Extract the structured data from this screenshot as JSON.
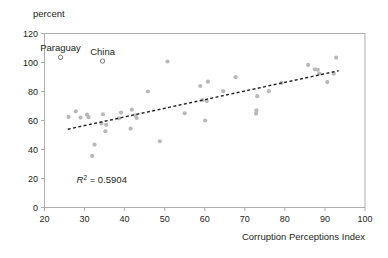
{
  "chart_data": {
    "type": "scatter",
    "title": "",
    "subtitle": "",
    "unit_label": "percent",
    "xlabel": "Corruption Perceptions Index",
    "ylabel": "",
    "xlim": [
      20,
      100
    ],
    "ylim": [
      0,
      120
    ],
    "xticks": [
      20,
      30,
      40,
      50,
      60,
      70,
      80,
      90,
      100
    ],
    "yticks": [
      0,
      20,
      40,
      60,
      80,
      100,
      120
    ],
    "grid": false,
    "legend": "none",
    "marker_color": "#b9b9b9",
    "highlight_marker_color": "#6d6d6d",
    "trendline_color": "#231f20",
    "axis_color": "#9a9a9a",
    "annotations": [
      {
        "label": "R² = 0.5904",
        "x": 28,
        "y": 17,
        "italic_prefix": "R",
        "superscript": "2",
        "rest": " = 0.5904"
      }
    ],
    "series": [
      {
        "name": "countries",
        "marker": "filled-circle",
        "points": [
          {
            "x": 26.0,
            "y": 62.5
          },
          {
            "x": 27.8,
            "y": 66.3
          },
          {
            "x": 29.0,
            "y": 62.0
          },
          {
            "x": 30.6,
            "y": 64.0
          },
          {
            "x": 31.0,
            "y": 62.3
          },
          {
            "x": 31.9,
            "y": 35.6
          },
          {
            "x": 32.5,
            "y": 43.3
          },
          {
            "x": 34.2,
            "y": 58.0
          },
          {
            "x": 34.6,
            "y": 64.3
          },
          {
            "x": 35.2,
            "y": 52.6
          },
          {
            "x": 35.4,
            "y": 57.0
          },
          {
            "x": 38.6,
            "y": 61.5
          },
          {
            "x": 39.1,
            "y": 65.5
          },
          {
            "x": 41.5,
            "y": 54.4
          },
          {
            "x": 41.8,
            "y": 67.5
          },
          {
            "x": 42.7,
            "y": 63.6
          },
          {
            "x": 43.0,
            "y": 61.8
          },
          {
            "x": 45.8,
            "y": 80.0
          },
          {
            "x": 48.8,
            "y": 45.7
          },
          {
            "x": 50.7,
            "y": 100.7
          },
          {
            "x": 55.0,
            "y": 65.0
          },
          {
            "x": 58.9,
            "y": 83.8
          },
          {
            "x": 59.4,
            "y": 74.0
          },
          {
            "x": 60.1,
            "y": 60.0
          },
          {
            "x": 60.5,
            "y": 73.4
          },
          {
            "x": 60.8,
            "y": 86.8
          },
          {
            "x": 64.6,
            "y": 80.2
          },
          {
            "x": 67.7,
            "y": 89.9
          },
          {
            "x": 72.8,
            "y": 64.8
          },
          {
            "x": 72.9,
            "y": 67.0
          },
          {
            "x": 73.1,
            "y": 76.8
          },
          {
            "x": 76.0,
            "y": 80.2
          },
          {
            "x": 79.2,
            "y": 86.0
          },
          {
            "x": 85.8,
            "y": 98.3
          },
          {
            "x": 87.5,
            "y": 95.3
          },
          {
            "x": 88.2,
            "y": 95.0
          },
          {
            "x": 88.6,
            "y": 92.4
          },
          {
            "x": 90.6,
            "y": 86.5
          },
          {
            "x": 92.2,
            "y": 92.3
          },
          {
            "x": 92.8,
            "y": 103.3
          }
        ]
      },
      {
        "name": "labeled-outliers",
        "marker": "open-circle",
        "points": [
          {
            "x": 24.0,
            "y": 103.6,
            "label": "Paraguay"
          },
          {
            "x": 34.5,
            "y": 101.0,
            "label": "China"
          }
        ]
      }
    ],
    "trendline": {
      "type": "linear",
      "x_start": 25.8,
      "y_start": 54.0,
      "x_end": 93.4,
      "y_end": 94.3,
      "r_squared": 0.5904
    }
  }
}
